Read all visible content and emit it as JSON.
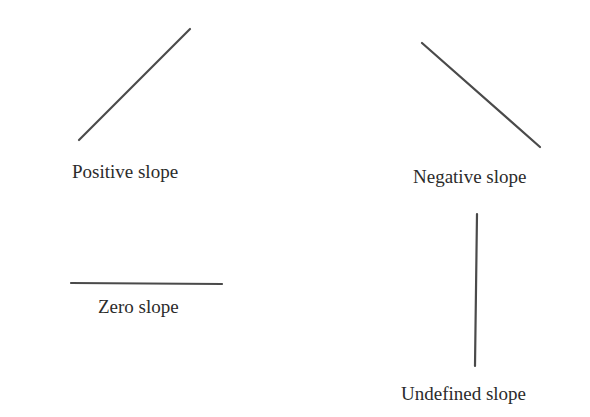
{
  "diagram": {
    "line_color": "#4a4a4a",
    "text_color": "#2b2b2b",
    "panels": [
      {
        "id": "positive",
        "label": "Positive slope",
        "line": {
          "x1": 79,
          "y1": 140,
          "x2": 190,
          "y2": 29
        }
      },
      {
        "id": "negative",
        "label": "Negative slope",
        "line": {
          "x1": 422,
          "y1": 43,
          "x2": 540,
          "y2": 147
        }
      },
      {
        "id": "zero",
        "label": "Zero slope",
        "line": {
          "x1": 71,
          "y1": 283,
          "x2": 222,
          "y2": 284
        }
      },
      {
        "id": "undefined",
        "label": "Undefined slope",
        "line": {
          "x1": 477,
          "y1": 214,
          "x2": 475,
          "y2": 366
        }
      }
    ]
  }
}
